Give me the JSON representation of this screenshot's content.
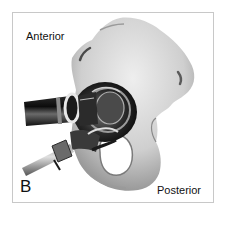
{
  "figure": {
    "panel_label": "B",
    "labels": {
      "anterior": "Anterior",
      "posterior": "Posterior"
    },
    "colors": {
      "border": "#c8c8c8",
      "bone_light": "#e6e6e6",
      "bone_mid": "#bdbdbd",
      "bone_dark": "#6a6a6a",
      "instrument_dark": "#151515",
      "instrument_mid": "#5a5a5a",
      "instrument_light": "#d8d8d8"
    }
  }
}
